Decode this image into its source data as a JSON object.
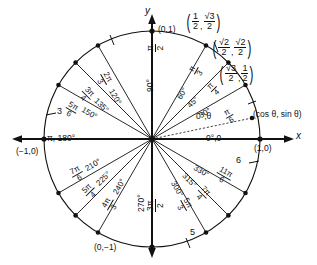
{
  "figure": {
    "type": "unit-circle",
    "axes": {
      "x_label": "x",
      "y_label": "y"
    },
    "cardinal_points": [
      {
        "name": "right",
        "coord": "(1,0)",
        "angle": "0°,0"
      },
      {
        "name": "top",
        "coord": "(0,1)",
        "angle_pi": "π/2",
        "angle_deg": "90°"
      },
      {
        "name": "left",
        "coord": "(−1,0)",
        "angle": "π, 180°"
      },
      {
        "name": "bottom",
        "coord": "(0,−1)",
        "angle_pi": "3π/2",
        "angle_deg": "270°"
      }
    ],
    "generic_point_label": "(cos θ, sin θ)",
    "generic_angle_label": "0°,θ",
    "quadrant1": [
      {
        "deg": "30°",
        "rad_num": "π",
        "rad_den": "6"
      },
      {
        "deg": "45°",
        "rad_num": "π",
        "rad_den": "4"
      },
      {
        "deg": "60°",
        "rad_num": "π",
        "rad_den": "3"
      }
    ],
    "quadrant2": [
      {
        "deg": "120°",
        "rad_num": "2π",
        "rad_den": "3"
      },
      {
        "deg": "135°",
        "rad_num": "3π",
        "rad_den": "4"
      },
      {
        "deg": "150°",
        "rad_num": "5π",
        "rad_den": "6"
      }
    ],
    "quadrant3": [
      {
        "deg": "210°",
        "rad_num": "7π",
        "rad_den": "6"
      },
      {
        "deg": "225°",
        "rad_num": "5π",
        "rad_den": "4"
      },
      {
        "deg": "240°",
        "rad_num": "4π",
        "rad_den": "3"
      }
    ],
    "quadrant4": [
      {
        "deg": "300°",
        "rad_num": "5π",
        "rad_den": "3"
      },
      {
        "deg": "315°",
        "rad_num": "7π",
        "rad_den": "4"
      },
      {
        "deg": "330°",
        "rad_num": "11π",
        "rad_den": "6"
      }
    ],
    "coordinate_callouts": [
      {
        "for": "60°",
        "x_num": "1",
        "x_den": "2",
        "y_num": "√3",
        "y_den": "2"
      },
      {
        "for": "45°",
        "x_num": "√2",
        "x_den": "2",
        "y_num": "√2",
        "y_den": "2"
      },
      {
        "for": "30°",
        "x_num": "√3",
        "x_den": "2",
        "y_num": "1",
        "y_den": "2"
      }
    ],
    "tick_numbers": [
      {
        "name": "tick-3",
        "value": "3"
      },
      {
        "name": "tick-6",
        "value": "6"
      },
      {
        "name": "tick-5",
        "value": "5"
      }
    ],
    "colors": {
      "ink": "#111111",
      "background": "#ffffff"
    }
  }
}
